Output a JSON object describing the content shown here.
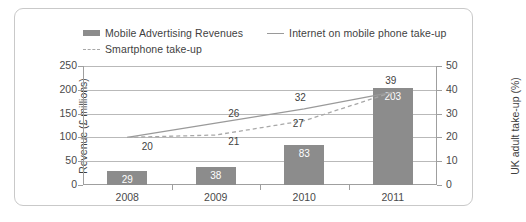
{
  "legend": {
    "items": [
      {
        "label": "Mobile Advertising Revenues",
        "marker": "bar-swatch"
      },
      {
        "label": "Internet on mobile phone take-up",
        "marker": "solid-line-swatch"
      },
      {
        "label": "Smartphone take-up",
        "marker": "dashed-line-swatch"
      }
    ]
  },
  "axes": {
    "left_title": "Revenue (£ millions)",
    "right_title": "UK adult take-up (%)",
    "left_ticks": [
      "250",
      "200",
      "150",
      "100",
      "50",
      "0"
    ],
    "right_ticks": [
      "50",
      "40",
      "30",
      "20",
      "10",
      "0"
    ]
  },
  "chart_data": {
    "type": "bar",
    "title": "",
    "subtitle": "",
    "xlabel": "",
    "ylabel": "Revenue (£ millions)",
    "y2label": "UK adult take-up (%)",
    "categories": [
      "2008",
      "2009",
      "2010",
      "2011"
    ],
    "ylim": [
      0,
      250
    ],
    "y2lim": [
      0,
      50
    ],
    "grid": true,
    "legend_position": "top",
    "series": [
      {
        "name": "Mobile Advertising Revenues",
        "type": "bar",
        "axis": "left",
        "color": "#8c8c8c",
        "values": [
          29,
          38,
          83,
          203
        ],
        "labels": [
          "29",
          "38",
          "83",
          "203"
        ]
      },
      {
        "name": "Internet on mobile phone take-up",
        "type": "line",
        "style": "solid",
        "axis": "right",
        "color": "#9a9a9a",
        "values": [
          20,
          26,
          32,
          39
        ],
        "labels": [
          "20",
          "26",
          "32",
          "39"
        ]
      },
      {
        "name": "Smartphone take-up",
        "type": "line",
        "style": "dashed",
        "axis": "right",
        "color": "#a8a8a8",
        "values": [
          20,
          21,
          27,
          39
        ],
        "labels": [
          "",
          "21",
          "27",
          ""
        ]
      }
    ]
  }
}
